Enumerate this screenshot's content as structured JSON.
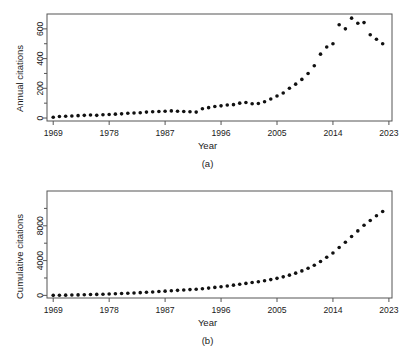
{
  "figure": {
    "background": "#ffffff",
    "point_color": "#111111",
    "axis_color": "#555555"
  },
  "panels": [
    {
      "caption": "(a)",
      "xlabel": "Year",
      "ylabel": "Annual citations"
    },
    {
      "caption": "(b)",
      "xlabel": "Year",
      "ylabel": "Cumulative citations"
    }
  ],
  "chart_data": [
    {
      "type": "scatter",
      "title": "",
      "xlabel": "Year",
      "ylabel": "Annual citations",
      "xlim": [
        1968,
        2023.5
      ],
      "ylim": [
        -20,
        700
      ],
      "xticks": [
        1969,
        1978,
        1987,
        1996,
        2005,
        2014,
        2023
      ],
      "xtick_labels": [
        "1969",
        "1978",
        "1987",
        "1996",
        "2005",
        "2014",
        "2023"
      ],
      "yticks": [
        0,
        200,
        400,
        600
      ],
      "ytick_labels": [
        "0",
        "200",
        "400",
        "600"
      ],
      "yminor_ticks": [
        100,
        300,
        500
      ],
      "grid": false,
      "legend": null,
      "x": [
        1969,
        1970,
        1971,
        1972,
        1973,
        1974,
        1975,
        1976,
        1977,
        1978,
        1979,
        1980,
        1981,
        1982,
        1983,
        1984,
        1985,
        1986,
        1987,
        1988,
        1989,
        1990,
        1991,
        1992,
        1993,
        1994,
        1995,
        1996,
        1997,
        1998,
        1999,
        2000,
        2001,
        2002,
        2003,
        2004,
        2005,
        2006,
        2007,
        2008,
        2009,
        2010,
        2011,
        2012,
        2013,
        2014,
        2015,
        2016,
        2017,
        2018,
        2019,
        2020,
        2021,
        2022
      ],
      "values": [
        5,
        10,
        12,
        14,
        16,
        18,
        20,
        18,
        22,
        24,
        26,
        28,
        32,
        34,
        36,
        40,
        42,
        44,
        46,
        48,
        46,
        44,
        42,
        40,
        62,
        70,
        78,
        82,
        88,
        90,
        100,
        104,
        96,
        98,
        110,
        128,
        148,
        168,
        200,
        228,
        260,
        300,
        352,
        430,
        478,
        500,
        628,
        600,
        672,
        638,
        642,
        560,
        530,
        500,
        488,
        480,
        470,
        462
      ]
    },
    {
      "type": "scatter",
      "title": "",
      "xlabel": "Year",
      "ylabel": "Cumulative citations",
      "xlim": [
        1968,
        2023.5
      ],
      "ylim": [
        -300,
        12000
      ],
      "xticks": [
        1969,
        1978,
        1987,
        1996,
        2005,
        2014,
        2023
      ],
      "xtick_labels": [
        "1969",
        "1978",
        "1987",
        "1996",
        "2005",
        "2014",
        "2023"
      ],
      "yticks": [
        0,
        4000,
        8000
      ],
      "ytick_labels": [
        "0",
        "4000",
        "8000"
      ],
      "yminor_ticks": [
        2000,
        6000,
        10000
      ],
      "grid": false,
      "legend": null,
      "x": [
        1969,
        1970,
        1971,
        1972,
        1973,
        1974,
        1975,
        1976,
        1977,
        1978,
        1979,
        1980,
        1981,
        1982,
        1983,
        1984,
        1985,
        1986,
        1987,
        1988,
        1989,
        1990,
        1991,
        1992,
        1993,
        1994,
        1995,
        1996,
        1997,
        1998,
        1999,
        2000,
        2001,
        2002,
        2003,
        2004,
        2005,
        2006,
        2007,
        2008,
        2009,
        2010,
        2011,
        2012,
        2013,
        2014,
        2015,
        2016,
        2017,
        2018,
        2019,
        2020,
        2021,
        2022
      ],
      "values": [
        5,
        15,
        27,
        41,
        57,
        75,
        95,
        113,
        135,
        159,
        185,
        213,
        245,
        279,
        315,
        355,
        397,
        441,
        487,
        535,
        581,
        625,
        667,
        707,
        769,
        839,
        917,
        999,
        1087,
        1177,
        1277,
        1381,
        1477,
        1575,
        1685,
        1813,
        1961,
        2129,
        2329,
        2557,
        2817,
        3117,
        3469,
        3899,
        4377,
        4877,
        5505,
        6105,
        6777,
        7415,
        8057,
        8617,
        9147,
        9647,
        10135,
        10615,
        11085,
        11547
      ]
    }
  ]
}
